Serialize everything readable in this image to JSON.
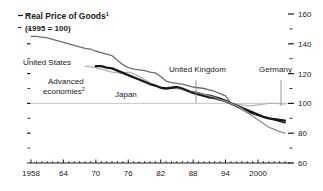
{
  "chart_data": {
    "type": "line",
    "title": "Real Price of Goods",
    "title_superscript": "1",
    "subtitle": "(1995 = 100)",
    "xlabel": "",
    "ylabel": "",
    "xlim": [
      1958,
      2005
    ],
    "ylim": [
      60,
      160
    ],
    "y_ticks_major": [
      60,
      80,
      100,
      120,
      140,
      160
    ],
    "y_ticks_minor": [
      70,
      90,
      110,
      130,
      150
    ],
    "y_axis_position": "right",
    "x_ticks_major": [
      1958,
      1964,
      1970,
      1976,
      1982,
      1988,
      1994,
      2000
    ],
    "x_tick_labels": [
      "1958",
      "64",
      "70",
      "76",
      "82",
      "88",
      "94",
      "2000"
    ],
    "x_tick_minor_step": 1,
    "grid": false,
    "reference_line": 100,
    "legend": "inline-annotations",
    "colors": {
      "united_states": "#6e6e6e",
      "advanced_economies": "#b3b3b3",
      "japan": "#1a1a1a",
      "united_kingdom": "#1a1a1a",
      "germany": "#8c8c8c",
      "axis": "#1a1a1a",
      "reference_line": "#c8c8c8",
      "text": "#1a1a1a"
    },
    "series": [
      {
        "name": "United States",
        "label": "United States",
        "color": "#6e6e6e",
        "width": 1.3,
        "x": [
          1958,
          1959,
          1960,
          1961,
          1962,
          1963,
          1964,
          1965,
          1966,
          1967,
          1968,
          1969,
          1970,
          1971,
          1972,
          1973,
          1974,
          1975,
          1976,
          1977,
          1978,
          1979,
          1980,
          1981,
          1982,
          1983,
          1984,
          1985,
          1986,
          1987,
          1988,
          1989,
          1990,
          1991,
          1992,
          1993,
          1994,
          1995,
          1996,
          1997,
          1998,
          1999,
          2000,
          2001,
          2002,
          2003,
          2004,
          2005
        ],
        "values": [
          145,
          145,
          144.5,
          144,
          143,
          142,
          141,
          140,
          139,
          138,
          137,
          136.5,
          135,
          134,
          133,
          132,
          129,
          126,
          124,
          123,
          122.5,
          122,
          121,
          120.5,
          118,
          115,
          114,
          113.5,
          113,
          112,
          111,
          110.5,
          110,
          109,
          108,
          106.5,
          105,
          100,
          98,
          96,
          94,
          93,
          92,
          91,
          90,
          89.5,
          89,
          88.5
        ]
      },
      {
        "name": "Advanced economies",
        "label": "Advanced economies",
        "label_superscript": "2",
        "color": "#b3b3b3",
        "width": 1.3,
        "x": [
          1968,
          1969,
          1970,
          1971,
          1972,
          1973,
          1974,
          1975,
          1976,
          1977,
          1978,
          1979,
          1980,
          1981,
          1982,
          1983,
          1984,
          1985,
          1986,
          1987,
          1988,
          1989,
          1990,
          1991,
          1992,
          1993,
          1994,
          1995,
          1996,
          1997,
          1998,
          1999,
          2000,
          2001,
          2002,
          2003,
          2004,
          2005
        ],
        "values": [
          125,
          124.5,
          124,
          123,
          122,
          121,
          120.5,
          120,
          121,
          120,
          118,
          116,
          114,
          112,
          110.5,
          110,
          110.5,
          110,
          109,
          108,
          107.5,
          107,
          106,
          105,
          104,
          103,
          101.5,
          100,
          99.5,
          99,
          98.5,
          98.5,
          99,
          99.5,
          100,
          100,
          99.8,
          99.5
        ]
      },
      {
        "name": "Japan",
        "label": "Japan",
        "color": "#1a1a1a",
        "width": 2.3,
        "x": [
          1970,
          1971,
          1972,
          1973,
          1974,
          1975,
          1976,
          1977,
          1978,
          1979,
          1980,
          1981,
          1982,
          1983,
          1984,
          1985,
          1986,
          1987,
          1988,
          1989,
          1990,
          1991,
          1992,
          1993,
          1994,
          1995,
          1996,
          1997,
          1998,
          1999,
          2000,
          2001,
          2002,
          2003,
          2004,
          2005
        ],
        "values": [
          125,
          125,
          124,
          123.5,
          122,
          120.5,
          119,
          117.5,
          116,
          114.5,
          113,
          112,
          110.5,
          110,
          110.5,
          111,
          110,
          108.5,
          107,
          106,
          105,
          104,
          103.5,
          102.5,
          101.5,
          100,
          98.5,
          97,
          95.5,
          94,
          92.5,
          91,
          90,
          89.5,
          89,
          88.5
        ]
      },
      {
        "name": "United Kingdom",
        "label": "United Kingdom",
        "color": "#1a1a1a",
        "width": 1.6,
        "x": [
          1988,
          1989,
          1990,
          1991,
          1992,
          1993,
          1994,
          1995,
          1996,
          1997,
          1998,
          1999,
          2000,
          2001,
          2002,
          2003,
          2004,
          2005
        ],
        "values": [
          108,
          107,
          106,
          105.5,
          104.5,
          103.5,
          102,
          100,
          98.5,
          97,
          95,
          93.5,
          92,
          91,
          90,
          89,
          88,
          87
        ]
      },
      {
        "name": "Germany",
        "label": "Germany",
        "color": "#8c8c8c",
        "width": 1.3,
        "x": [
          1988,
          1989,
          1990,
          1991,
          1992,
          1993,
          1994,
          1995,
          1996,
          1997,
          1998,
          1999,
          2000,
          2001,
          2002,
          2003,
          2004,
          2005
        ],
        "values": [
          108,
          107,
          106,
          105,
          104,
          102.5,
          101.5,
          100,
          98.5,
          96.5,
          94,
          91.5,
          89,
          86.5,
          84,
          82.5,
          81,
          80
        ]
      }
    ],
    "annotations": [
      {
        "id": "united-states",
        "text": "United States",
        "x": 23,
        "y": 65
      },
      {
        "id": "advanced-economies",
        "text": "Advanced",
        "x": 48,
        "y": 84
      },
      {
        "id": "advanced-economies-2",
        "text": "economies",
        "x": 43,
        "y": 94,
        "superscript": "2"
      },
      {
        "id": "japan",
        "text": "Japan",
        "x": 115,
        "y": 97
      },
      {
        "id": "united-kingdom",
        "text": "United Kingdom",
        "x": 169,
        "y": 72
      },
      {
        "id": "germany",
        "text": "Germany",
        "x": 259,
        "y": 72
      }
    ]
  }
}
